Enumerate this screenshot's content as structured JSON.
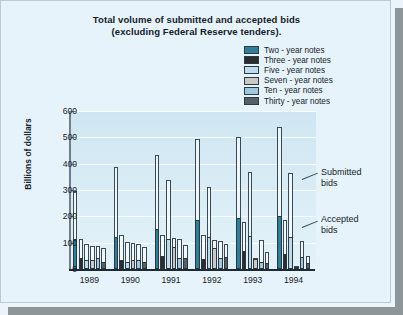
{
  "chart_data": {
    "type": "bar",
    "title": "Total volume of submitted and accepted bids (excluding Federal Reserve tenders).",
    "title_line1": "Total volume of submitted and accepted bids",
    "title_line2": "(excluding Federal Reserve tenders).",
    "xlabel": "",
    "ylabel": "Billions of dollars",
    "ylim": [
      0,
      600
    ],
    "yticks": [
      0,
      100,
      200,
      300,
      400,
      500,
      600
    ],
    "ytick_labels": [
      "0",
      "100",
      "200",
      "300",
      "400",
      "500",
      "600"
    ],
    "grid": true,
    "legend_position": "top-right",
    "categories": [
      "1989",
      "1990",
      "1991",
      "1992",
      "1993",
      "1994"
    ],
    "legend": [
      "Two - year notes",
      "Three - year notes",
      "Five - year notes",
      "Seven - year notes",
      "Ten - year notes",
      "Thirty - year notes"
    ],
    "colors": {
      "two_year": "#2f7f96",
      "three_year": "#2a2e31",
      "five_year": "#bcdcec",
      "seven_year": "#c9c9c9",
      "ten_year": "#9fc8de",
      "thirty_year": "#595f63",
      "plot_background": "#d9ecf5",
      "page_background": "#e7f3fa",
      "axis": "#1d2a33",
      "frame_shadow": "#8f9699"
    },
    "annotations": [
      {
        "text_line1": "Submitted",
        "text_line2": "bids"
      },
      {
        "text_line1": "Accepted",
        "text_line2": "bids"
      }
    ],
    "series": [
      {
        "name": "Two - year notes",
        "color": "#2f7f96",
        "submitted": [
          298,
          388,
          433,
          494,
          503,
          540
        ],
        "accepted": [
          113,
          122,
          153,
          188,
          193,
          203
        ]
      },
      {
        "name": "Three - year notes",
        "color": "#2a2e31",
        "submitted": [
          113,
          131,
          128,
          128,
          177,
          187
        ],
        "accepted": [
          40,
          33,
          48,
          38,
          70,
          56
        ]
      },
      {
        "name": "Five - year notes",
        "color": "#bcdcec",
        "submitted": [
          95,
          102,
          339,
          311,
          368,
          365
        ],
        "accepted": [
          36,
          28,
          114,
          122,
          127,
          120
        ]
      },
      {
        "name": "Seven - year notes",
        "color": "#c9c9c9",
        "submitted": [
          88,
          97,
          117,
          110,
          43,
          10
        ],
        "accepted": [
          34,
          35,
          82,
          80,
          39,
          8
        ]
      },
      {
        "name": "Ten - year notes",
        "color": "#9fc8de",
        "submitted": [
          86,
          94,
          114,
          108,
          110,
          105
        ],
        "accepted": [
          42,
          34,
          43,
          40,
          26,
          44
        ]
      },
      {
        "name": "Thirty - year notes",
        "color": "#595f63",
        "submitted": [
          78,
          83,
          91,
          95,
          64,
          50
        ],
        "accepted": [
          28,
          25,
          41,
          44,
          24,
          22
        ]
      }
    ]
  }
}
